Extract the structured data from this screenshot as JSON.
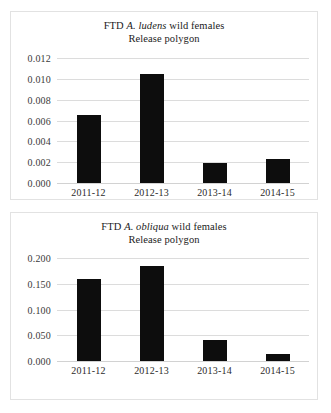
{
  "figure": {
    "background": "#ffffff",
    "bar_color": "#0d0d0d",
    "gridline_color": "#dcdcdc"
  },
  "chart_data": [
    {
      "type": "bar",
      "panel": "top",
      "title_line1_prefix": "FTD ",
      "title_line1_species": "A. ludens",
      "title_line1_suffix": " wild females",
      "title_line2": "Release polygon",
      "title": "FTD A. ludens wild females Release polygon",
      "categories": [
        "2011-12",
        "2012-13",
        "2013-14",
        "2014-15"
      ],
      "values": [
        0.0065,
        0.0105,
        0.0019,
        0.0023
      ],
      "yticks": [
        "0.012",
        "0.010",
        "0.008",
        "0.006",
        "0.004",
        "0.002",
        "0.000"
      ],
      "ytick_values": [
        0.012,
        0.01,
        0.008,
        0.006,
        0.004,
        0.002,
        0.0
      ],
      "ylim": [
        0,
        0.012
      ],
      "xlabel": "",
      "ylabel": "",
      "grid": true,
      "legend": "none"
    },
    {
      "type": "bar",
      "panel": "bottom",
      "title_line1_prefix": "FTD ",
      "title_line1_species": "A. obliqua",
      "title_line1_suffix": " wild females",
      "title_line2": "Release polygon",
      "title": "FTD A. obliqua wild females Release polygon",
      "categories": [
        "2011-12",
        "2012-13",
        "2013-14",
        "2014-15"
      ],
      "values": [
        0.16,
        0.185,
        0.04,
        0.014
      ],
      "yticks": [
        "0.200",
        "0.150",
        "0.100",
        "0.050",
        "0.000"
      ],
      "ytick_values": [
        0.2,
        0.15,
        0.1,
        0.05,
        0.0
      ],
      "ylim": [
        0,
        0.2
      ],
      "xlabel": "",
      "ylabel": "",
      "grid": true,
      "legend": "none"
    }
  ]
}
